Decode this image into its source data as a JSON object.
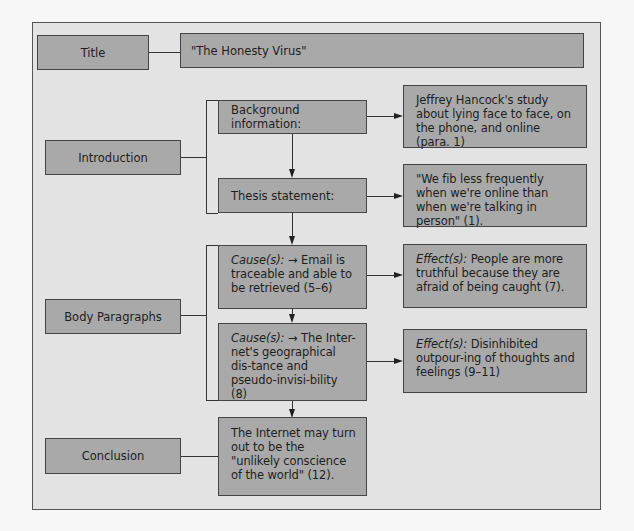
{
  "diagram": {
    "rows": {
      "title": {
        "label": "Title",
        "content": "\"The Honesty Virus\""
      },
      "introduction": {
        "label": "Introduction",
        "background_label": "Background information:",
        "background_detail": "Jeffrey Hancock's study about lying face to face, on the phone, and online (para. 1)",
        "thesis_label": "Thesis statement:",
        "thesis_detail": "\"We fib less frequently when we're online than when we're talking in person\" (1)."
      },
      "body": {
        "label": "Body Paragraphs",
        "cause1_prefix": "Cause(s):",
        "cause1_text": " → Email is traceable and able to be retrieved (5–6)",
        "effect1_prefix": "Effect(s):",
        "effect1_text": " People are more truthful because they are afraid of being caught (7).",
        "cause2_prefix": "Cause(s):",
        "cause2_text": " → The Inter-net's geographical dis-tance and pseudo-invisi-bility (8)",
        "effect2_prefix": "Effect(s):",
        "effect2_text": " Disinhibited outpour-ing of thoughts and feelings (9–11)"
      },
      "conclusion": {
        "label": "Conclusion",
        "content": "The Internet may turn out to be the \"unlikely conscience of the world\" (12)."
      }
    },
    "colors": {
      "box_fill": "#a9a9a9",
      "panel_fill": "#e3e3e3",
      "border": "#444444"
    }
  }
}
